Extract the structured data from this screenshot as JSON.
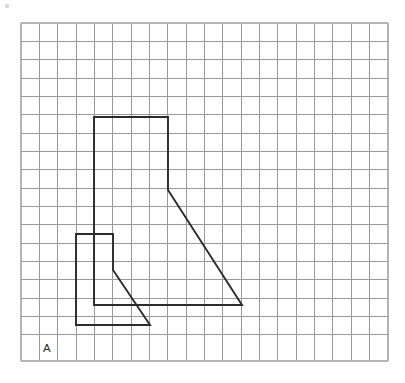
{
  "figure": {
    "background_color": "#ffffff",
    "label": "A",
    "label_position": {
      "x": 43,
      "y": 352
    }
  },
  "grid": {
    "origin_x": 21,
    "origin_y": 23,
    "cell_size": 18.35,
    "columns": 20,
    "rows": 18.4,
    "width": 367,
    "height": 338,
    "line_color": "#9a9a9a",
    "edge_color": "#b4b4b4",
    "visible": true
  },
  "chart_data": {
    "type": "scatter",
    "xlabel": "",
    "ylabel": "",
    "xlim": [
      0,
      20
    ],
    "ylim": [
      0,
      18.4
    ],
    "grid": true,
    "legend": "none",
    "annotations": [
      {
        "text": "A",
        "x": 1.2,
        "y": 17.9
      }
    ],
    "series": [
      {
        "name": "large-shape",
        "type": "polyline",
        "closed": true,
        "stroke": "#2b2b2b",
        "points_grid": [
          [
            4,
            5.1
          ],
          [
            8,
            5.1
          ],
          [
            8,
            9.1
          ],
          [
            12,
            15.4
          ],
          [
            4,
            15.4
          ]
        ],
        "points_px": [
          [
            94,
            117
          ],
          [
            168,
            117
          ],
          [
            168,
            190
          ],
          [
            242,
            305
          ],
          [
            94,
            305
          ]
        ]
      },
      {
        "name": "small-shape",
        "type": "polyline",
        "closed": true,
        "stroke": "#2b2b2b",
        "points_grid": [
          [
            3,
            11.5
          ],
          [
            5,
            11.5
          ],
          [
            5,
            13.5
          ],
          [
            7,
            16.5
          ],
          [
            3,
            16.5
          ]
        ],
        "points_px": [
          [
            76,
            234
          ],
          [
            113,
            234
          ],
          [
            113,
            270
          ],
          [
            150,
            325
          ],
          [
            76,
            325
          ]
        ]
      }
    ]
  },
  "shapes": [
    {
      "id": "large-shape",
      "name": "Large quadrilateral with sloped right edge",
      "path": "M 94 117 L 168 117 L 168 190 L 242 305 L 94 305 Z",
      "stroke_color": "#2b2b2b",
      "stroke_width": 1.9
    },
    {
      "id": "small-shape",
      "name": "Small quadrilateral with sloped right edge",
      "path": "M 76 234 L 113 234 L 113 270 L 150 325 L 76 325 Z",
      "stroke_color": "#2b2b2b",
      "stroke_width": 1.9
    }
  ]
}
